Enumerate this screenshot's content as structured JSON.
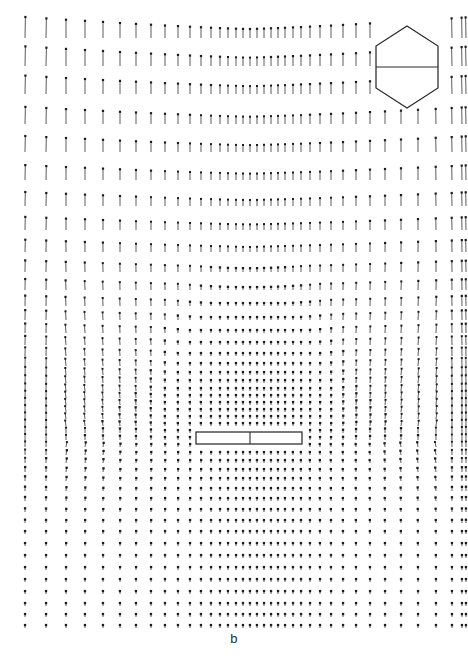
{
  "figure": {
    "panel_label": "b",
    "background_color": "#ffffff",
    "vector_color": "#262626",
    "outline_color": "#2a2a2a"
  },
  "chart_data": {
    "type": "scatter",
    "title": "",
    "subtitle": "",
    "xlabel": "",
    "ylabel": "",
    "annotations": [
      "b"
    ],
    "legend": [],
    "grid": false,
    "plot_kind": "vector-field-quiver",
    "xlim": [
      0,
      468
    ],
    "ylim": [
      0,
      657
    ],
    "arrow_direction_deg": 90,
    "columns": {
      "count": 38,
      "spacing_mode": "stretched-symmetric-dense-center",
      "x_positions": [
        25,
        46,
        66,
        85,
        103,
        120,
        136,
        151,
        165,
        178,
        190,
        201,
        211,
        220,
        228,
        236,
        243,
        250,
        257,
        264,
        271,
        278,
        285,
        293,
        301,
        310,
        320,
        331,
        343,
        356,
        370,
        385,
        401,
        418,
        436,
        452,
        462,
        466
      ]
    },
    "rows": {
      "count": 45,
      "spacing_mode": "stretched-dense-bottom",
      "y_positions": [
        38,
        66,
        94,
        124,
        152,
        180,
        206,
        230,
        252,
        272,
        290,
        306,
        320,
        333,
        345,
        356,
        366,
        375,
        383,
        391,
        398,
        405,
        412,
        419,
        426,
        433,
        440,
        447,
        455,
        463,
        472,
        481,
        491,
        501,
        512,
        523,
        534,
        546,
        558,
        570,
        582,
        594,
        606,
        617,
        628
      ]
    },
    "arrow_lengths": {
      "max_px": 22,
      "min_px": 3,
      "note": "Length is maximal in upper rows and at left/right margins; shrinks to near-zero dots approaching the obstacle and in the dense lower-center wake region."
    },
    "obstacle": {
      "shape": "rectangle",
      "x": 196,
      "y": 432,
      "width": 106,
      "height": 12,
      "divider": {
        "type": "vertical-line",
        "x": 250
      }
    },
    "inset": {
      "shape": "hexagon",
      "center_x": 407,
      "center_y": 67,
      "half_width": 31,
      "half_height": 41,
      "flat_top_y": 46,
      "flat_bottom_y": 88,
      "divider": {
        "type": "horizontal-line",
        "y": 67
      }
    }
  }
}
